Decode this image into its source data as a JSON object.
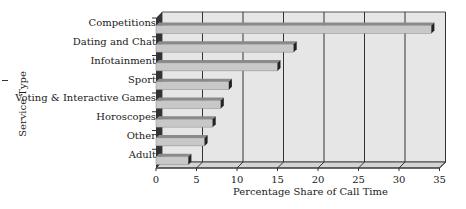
{
  "chart_data": {
    "type": "bar",
    "orientation": "horizontal",
    "style": "3d",
    "title": "",
    "xlabel": "Percentage Share of Call Time",
    "ylabel": "Service Type",
    "categories": [
      "Competitions",
      "Dating and Chat",
      "Infotainment",
      "Sport",
      "Voting & Interactive Games",
      "Horoscopes",
      "Other",
      "Adult"
    ],
    "values": [
      34,
      17,
      15,
      9,
      8,
      7,
      6,
      4
    ],
    "xlim": [
      0,
      35
    ],
    "xticks": [
      "0",
      "5",
      "10",
      "15",
      "20",
      "25",
      "30",
      "35"
    ],
    "grid": true,
    "legend": null
  },
  "colors": {
    "plot_bg": "#e6e6e6",
    "bar_face": "#c8c8c8",
    "bar_top": "#8a8a8a",
    "bar_end": "#222222",
    "grid": "#333333"
  }
}
